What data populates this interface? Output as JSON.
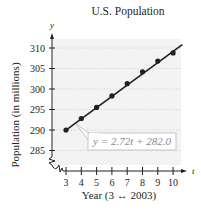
{
  "chart_data": {
    "type": "scatter",
    "title": "U.S. Population",
    "xlabel": "Year (3 ↔ 2003)",
    "ylabel": "Population (in millions)",
    "x_axis_var": "t",
    "y_axis_var": "y",
    "x": [
      3,
      4,
      5,
      6,
      7,
      8,
      9,
      10
    ],
    "series": [
      {
        "name": "Population data",
        "values": [
          290.0,
          292.8,
          295.5,
          298.3,
          301.3,
          304.2,
          306.8,
          308.8
        ],
        "style": "points"
      },
      {
        "name": "Regression line",
        "equation": "y = 2.72t + 282.0",
        "slope": 2.72,
        "intercept": 282.0,
        "style": "line"
      }
    ],
    "annotations": [
      {
        "text": "y = 2.72t + 282.0",
        "points_to": "regression line near t = 4.3"
      }
    ],
    "x_ticks": [
      "3",
      "4",
      "5",
      "6",
      "7",
      "8",
      "9",
      "10"
    ],
    "y_ticks": [
      "285",
      "290",
      "295",
      "300",
      "305",
      "310"
    ],
    "xlim": [
      2.5,
      10.5
    ],
    "ylim": [
      283,
      313
    ],
    "grid": "horizontal dotted lines",
    "axis_break": true,
    "legend": "none",
    "colors": {
      "line": "#231f20",
      "points": "#231f20",
      "plot_background": "#f3f3f3",
      "grid": "#cfcfcf",
      "callout_border": "#b9b9b9"
    }
  }
}
